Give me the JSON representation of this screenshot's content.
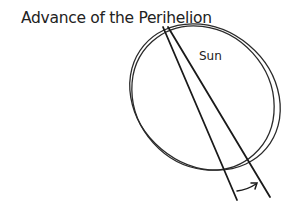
{
  "diagram": {
    "title": "Advance of the Perihelion",
    "labels": {
      "sun": "Sun"
    },
    "elements": [
      {
        "type": "orbit-ellipse",
        "name": "orbit-1"
      },
      {
        "type": "orbit-ellipse",
        "name": "orbit-2"
      },
      {
        "type": "line",
        "name": "apsidal-line-1"
      },
      {
        "type": "line",
        "name": "apsidal-line-2"
      },
      {
        "type": "arrow",
        "name": "precession-arrow"
      }
    ],
    "colors": {
      "stroke": "#222222",
      "background": "#ffffff"
    }
  }
}
